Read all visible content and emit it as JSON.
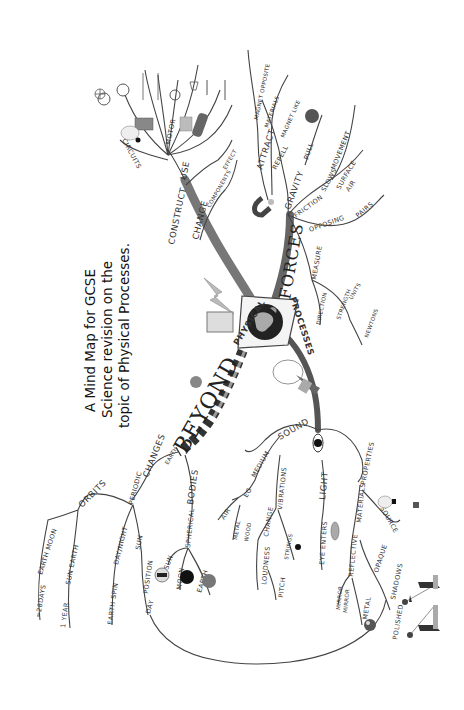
{
  "caption": {
    "line1": "A Mind Map for GCSE",
    "line2": "Science revision on the",
    "line3": "topic of Physical Processes."
  },
  "center": {
    "title_left": "PHYSICAL",
    "title_right": "PROCESSES",
    "icon": "globe-icon"
  },
  "branches": {
    "forces": {
      "label": "FORCES",
      "gravity": "GRAVITY",
      "pull": "PULL",
      "friction": "FRICTION",
      "slows": "SLOWS",
      "movement": "MOVEMENT",
      "surface": "SURFACE",
      "air": "AIR",
      "opposing": "OPPOSING",
      "pairs": "PAIRS",
      "measure": "MEASURE",
      "direction": "DIRECTION",
      "strength": "STRENGTH",
      "units": "UNITS",
      "newtons": "NEWTONS",
      "attract": "ATTRACT",
      "magnet_opposite": "MAGNET OPPOSITE",
      "materials": "MATERIALS",
      "repell": "REPELL",
      "magnet_like": "MAGNET LIKE"
    },
    "electricity": {
      "construct": "CONSTRUCT",
      "use": "USE",
      "circuits": "CIRCUITS",
      "motor": "MOTOR",
      "change": "CHANGE",
      "components": "COMPONENTS",
      "effect": "EFFECT"
    },
    "beyond": {
      "label": "BEYOND",
      "earth_prefix": "EARTH",
      "periodic": "PERIODIC",
      "changes": "CHANGES",
      "orbits": "ORBITS",
      "earth_moon": "EARTH MOON",
      "days28": "≈28DAYS",
      "sun_earth": "SUN EARTH",
      "year1": "1 YEAR",
      "day_night": "DAY/NIGHT",
      "earth_spin": "EARTH SPIN",
      "sun": "SUN",
      "position": "POSITION",
      "day": "DAY",
      "bodies": "BODIES",
      "spherical": "SPHERICAL",
      "sun2": "SUN",
      "moon": "MOON",
      "earth": "EARTH"
    },
    "waves": {
      "sound": "SOUND",
      "medium": "MEDIUM",
      "eg": "EG",
      "air": "AIR",
      "metal": "METAL",
      "wood": "WOOD",
      "vibrations": "VIBRATIONS",
      "change": "CHANGE",
      "loudness": "LOUDNESS",
      "pitch": "PITCH",
      "strings": "STRINGS",
      "light": "LIGHT",
      "eye_enters": "EYE ENTERS",
      "properties": "PROPERTIES",
      "materials": "MATERIALS",
      "reflective": "REFLECTIVE",
      "mirror": "MIRROR",
      "mirror_rev": "MIRROR",
      "polished": "POLISHED",
      "opaque": "OPAQUE",
      "shadows": "SHADOWS",
      "source": "SOURCE"
    }
  },
  "colors": {
    "ink": "#333333",
    "trunk": "#555555",
    "paper": "#ffffff"
  }
}
